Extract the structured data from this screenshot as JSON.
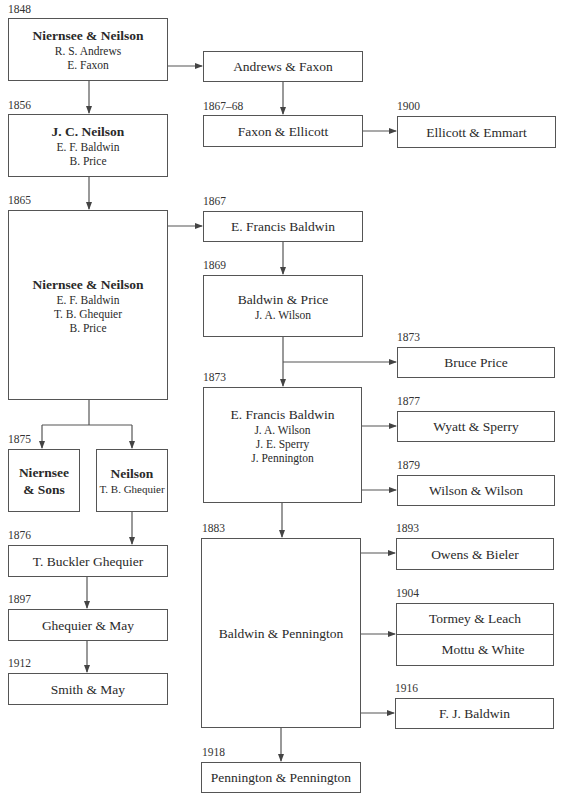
{
  "diagram": {
    "type": "firm-lineage-flowchart",
    "nodes": [
      {
        "id": "A",
        "year": "1848",
        "title": "Niernsee & Neilson",
        "bold": true,
        "members": [
          "R. S. Andrews",
          "E. Faxon"
        ]
      },
      {
        "id": "B",
        "year": "1856",
        "title": "J. C. Neilson",
        "bold": true,
        "members": [
          "E. F. Baldwin",
          "B. Price"
        ]
      },
      {
        "id": "C",
        "year": "1865",
        "title": "Niernsee & Neilson",
        "bold": true,
        "members": [
          "E. F. Baldwin",
          "T. B. Ghequier",
          "B. Price"
        ]
      },
      {
        "id": "D",
        "year": "1875",
        "title": "Niernsee & Sons",
        "title_lines": [
          "Niernsee",
          "& Sons"
        ],
        "bold": true,
        "members": []
      },
      {
        "id": "E",
        "year": "",
        "title": "Neilson",
        "bold": true,
        "members": [
          "T. B. Ghequier"
        ]
      },
      {
        "id": "F",
        "year": "1876",
        "title": "T. Buckler Ghequier",
        "bold": false,
        "members": []
      },
      {
        "id": "G",
        "year": "1897",
        "title": "Ghequier & May",
        "bold": false,
        "members": []
      },
      {
        "id": "H",
        "year": "1912",
        "title": "Smith & May",
        "bold": false,
        "members": []
      },
      {
        "id": "I",
        "year": "",
        "title": "Andrews & Faxon",
        "bold": false,
        "members": []
      },
      {
        "id": "J",
        "year": "1867–68",
        "title": "Faxon & Ellicott",
        "bold": false,
        "members": []
      },
      {
        "id": "K",
        "year": "1900",
        "title": "Ellicott & Emmart",
        "bold": false,
        "members": []
      },
      {
        "id": "L",
        "year": "1867",
        "title": "E. Francis Baldwin",
        "bold": false,
        "members": []
      },
      {
        "id": "M",
        "year": "1869",
        "title": "Baldwin & Price",
        "bold": false,
        "members": [
          "J. A. Wilson"
        ]
      },
      {
        "id": "N",
        "year": "1873",
        "title": "Bruce Price",
        "bold": false,
        "members": []
      },
      {
        "id": "O",
        "year": "1873",
        "title": "E. Francis Baldwin",
        "bold": false,
        "members": [
          "J. A. Wilson",
          "J. E. Sperry",
          "J. Pennington"
        ]
      },
      {
        "id": "P",
        "year": "1877",
        "title": "Wyatt & Sperry",
        "bold": false,
        "members": []
      },
      {
        "id": "Q",
        "year": "1879",
        "title": "Wilson & Wilson",
        "bold": false,
        "members": []
      },
      {
        "id": "R",
        "year": "1883",
        "title": "Baldwin & Pennington",
        "bold": false,
        "members": []
      },
      {
        "id": "S",
        "year": "1893",
        "title": "Owens & Bieler",
        "bold": false,
        "members": []
      },
      {
        "id": "T",
        "year": "1904",
        "title": "Tormey & Leach / Mottu & White",
        "parts": [
          "Tormey & Leach",
          "Mottu & White"
        ],
        "bold": false,
        "members": []
      },
      {
        "id": "U",
        "year": "1916",
        "title": "F. J. Baldwin",
        "bold": false,
        "members": []
      },
      {
        "id": "V",
        "year": "1918",
        "title": "Pennington & Pennington",
        "bold": false,
        "members": []
      }
    ],
    "edges": [
      [
        "A",
        "B"
      ],
      [
        "A",
        "I"
      ],
      [
        "I",
        "J"
      ],
      [
        "J",
        "K"
      ],
      [
        "B",
        "C"
      ],
      [
        "C",
        "L"
      ],
      [
        "C",
        "D"
      ],
      [
        "C",
        "E"
      ],
      [
        "E",
        "F"
      ],
      [
        "F",
        "G"
      ],
      [
        "G",
        "H"
      ],
      [
        "L",
        "M"
      ],
      [
        "M",
        "N"
      ],
      [
        "M",
        "O"
      ],
      [
        "O",
        "P"
      ],
      [
        "O",
        "Q"
      ],
      [
        "O",
        "R"
      ],
      [
        "R",
        "S"
      ],
      [
        "R",
        "T"
      ],
      [
        "R",
        "U"
      ],
      [
        "R",
        "V"
      ]
    ],
    "colors": {
      "line": "#555555",
      "text": "#2a2a2a",
      "background": "#ffffff"
    }
  }
}
